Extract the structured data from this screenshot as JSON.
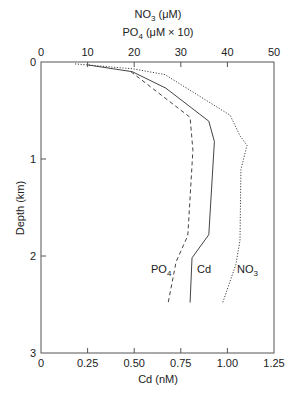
{
  "chart_data": {
    "type": "line",
    "title": "",
    "top_axis": {
      "label_line1": "NO3 (μM)",
      "label_line2": "PO4 (μM × 10)",
      "range": [
        0,
        50
      ],
      "ticks": [
        0,
        10,
        20,
        30,
        40,
        50
      ]
    },
    "bottom_axis": {
      "label": "Cd (nM)",
      "range": [
        0,
        1.25
      ],
      "ticks": [
        "0",
        "0.25",
        "0.50",
        "0.75",
        "1.00",
        "1.25"
      ]
    },
    "y_axis": {
      "label": "Depth (km)",
      "range": [
        0,
        3
      ],
      "inverted": true,
      "ticks": [
        0,
        1,
        2,
        3
      ]
    },
    "grid": false,
    "series": [
      {
        "name": "Cd",
        "label": "Cd",
        "axis": "bottom",
        "style": "solid",
        "units": "nM",
        "points": [
          [
            0.25,
            0.03
          ],
          [
            0.49,
            0.1
          ],
          [
            0.67,
            0.27
          ],
          [
            0.9,
            0.61
          ],
          [
            0.93,
            0.82
          ],
          [
            0.9,
            1.78
          ],
          [
            0.81,
            2.02
          ],
          [
            0.8,
            2.48
          ]
        ]
      },
      {
        "name": "PO4",
        "label": "PO4",
        "axis": "top",
        "style": "dashed",
        "units": "μM × 10",
        "points": [
          [
            19.3,
            0.1
          ],
          [
            32.0,
            0.57
          ],
          [
            32.6,
            0.91
          ],
          [
            31.5,
            1.79
          ],
          [
            29.0,
            2.06
          ],
          [
            27.3,
            2.48
          ]
        ]
      },
      {
        "name": "NO3",
        "label": "NO3",
        "axis": "top",
        "style": "dotted",
        "units": "μM",
        "points": [
          [
            7.3,
            0.02
          ],
          [
            19.7,
            0.07
          ],
          [
            26.6,
            0.13
          ],
          [
            40.6,
            0.55
          ],
          [
            42.7,
            0.76
          ],
          [
            44.2,
            0.86
          ],
          [
            42.9,
            1.11
          ],
          [
            42.7,
            1.84
          ],
          [
            41.8,
            2.09
          ],
          [
            39.0,
            2.48
          ]
        ]
      }
    ],
    "annotations": [
      {
        "text": "PO4",
        "near_depth": 2.2
      },
      {
        "text": "Cd",
        "near_depth": 2.2
      },
      {
        "text": "NO3",
        "near_depth": 2.2
      }
    ]
  },
  "labels": {
    "top_title_1_main": "NO",
    "top_title_1_sub": "3",
    "top_title_1_rest": " (μM)",
    "top_title_2_main": "PO",
    "top_title_2_sub": "4",
    "top_title_2_rest": " (μM × 10)",
    "ylabel": "Depth (km)",
    "xlabel": "Cd (nM)",
    "series_po4_main": "PO",
    "series_po4_sub": "4",
    "series_cd": "Cd",
    "series_no3_main": "NO",
    "series_no3_sub": "3"
  }
}
